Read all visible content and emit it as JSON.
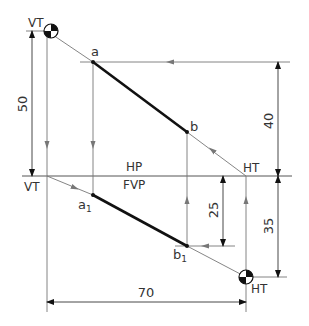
{
  "diagram": {
    "type": "orthographic projection of a line (traces)",
    "colors": {
      "line_main": "#111111",
      "line_thin": "#6e6e6e",
      "background": "#ffffff"
    },
    "labels": {
      "vt_top": "VT",
      "vt_xy": "VT",
      "ht_xy": "HT",
      "ht_bottom": "HT",
      "hp": "HP",
      "fvp": "FVP",
      "point_a": "a",
      "point_b": "b",
      "point_a1": "a",
      "point_a1_sub": "1",
      "point_b1": "b",
      "point_b1_sub": "1"
    },
    "dimensions": {
      "d50": "50",
      "d40": "40",
      "d35": "35",
      "d25": "25",
      "d70": "70"
    },
    "points": {
      "VT_top": [
        47,
        31
      ],
      "a": [
        93,
        62
      ],
      "b": [
        187,
        132
      ],
      "HT_xy": [
        246,
        176
      ],
      "VT_xy": [
        47,
        176
      ],
      "a1": [
        93,
        195
      ],
      "b1": [
        187,
        246
      ],
      "HT_bottom": [
        246,
        277
      ]
    }
  }
}
